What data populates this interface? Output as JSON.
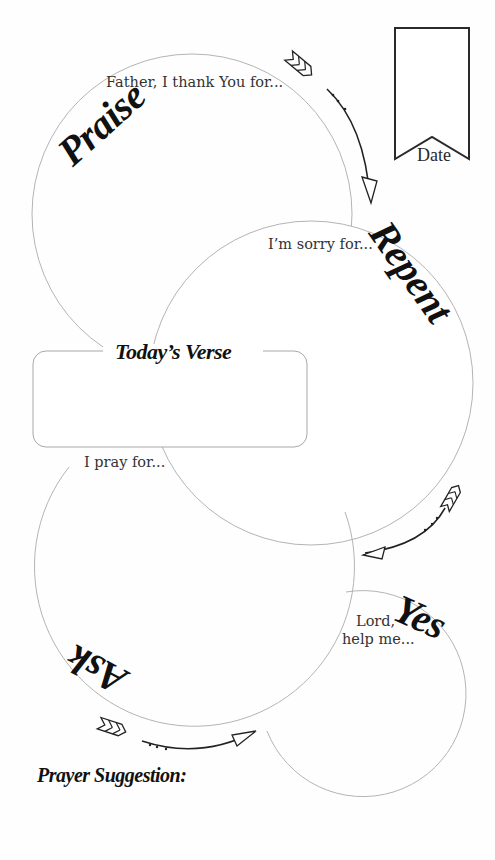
{
  "sections": {
    "praise": {
      "title": "Praise",
      "prompt": "Father, I thank You for..."
    },
    "repent": {
      "title": "Repent",
      "prompt": "I’m sorry for..."
    },
    "ask": {
      "title": "Ask",
      "prompt": "I pray for..."
    },
    "yes": {
      "title": "Yes",
      "prompt_line1": "Lord,",
      "prompt_line2": "help me..."
    }
  },
  "verse": {
    "heading": "Today’s Verse",
    "value": ""
  },
  "date": {
    "label": "Date",
    "value": ""
  },
  "footer": {
    "heading": "Prayer Suggestion:",
    "value": ""
  },
  "colors": {
    "circle_stroke": "#b4b4b4",
    "ink": "#111111",
    "prompt_text": "#333333"
  }
}
